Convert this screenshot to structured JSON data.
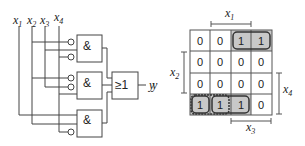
{
  "circuit": {
    "inputs": [
      "x1",
      "x2",
      "x3",
      "x4"
    ],
    "input_labels": [
      {
        "base": "x",
        "sub": "1"
      },
      {
        "base": "x",
        "sub": "2"
      },
      {
        "base": "x",
        "sub": "3"
      },
      {
        "base": "x",
        "sub": "4"
      }
    ],
    "gates": [
      {
        "type": "AND",
        "symbol": "&",
        "inputs": [
          "x2'",
          "x3",
          "x4'"
        ]
      },
      {
        "type": "AND",
        "symbol": "&",
        "inputs": [
          "x2'",
          "x3'",
          "x4"
        ]
      },
      {
        "type": "AND",
        "symbol": "&",
        "inputs": [
          "x1",
          "x2",
          "x4'"
        ]
      }
    ],
    "or_gate": {
      "type": "OR",
      "symbol": "≥1"
    },
    "output_label": "y"
  },
  "kmap": {
    "output_label": "y",
    "rows": [
      [
        "0",
        "0",
        "1",
        "1"
      ],
      [
        "0",
        "0",
        "0",
        "0"
      ],
      [
        "0",
        "0",
        "0",
        "0"
      ],
      [
        "1",
        "1",
        "1",
        "0"
      ]
    ],
    "labels": {
      "top": {
        "base": "x",
        "sub": "1"
      },
      "left": {
        "base": "x",
        "sub": "2"
      },
      "right": {
        "base": "x",
        "sub": "4"
      },
      "bottom": {
        "base": "x",
        "sub": "3"
      }
    },
    "colors": {
      "shade": "#c8c8c8",
      "grid": "#555555",
      "group_border": "#333333"
    }
  }
}
